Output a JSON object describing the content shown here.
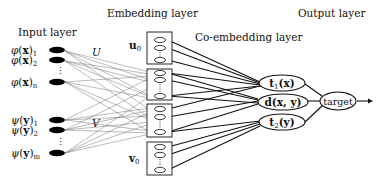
{
  "titles": {
    "input_layer": "Input layer",
    "embedding_layer": "Embedding layer",
    "coembedding_layer": "Co-embedding layer",
    "output_layer": "Output layer"
  },
  "weights": {
    "U": "U",
    "V": "V"
  },
  "input_nodes": {
    "phi": {
      "func": "φ",
      "var": "x",
      "indices": [
        "1",
        "2",
        "n"
      ]
    },
    "psi": {
      "func": "ψ",
      "var": "y",
      "indices": [
        "1",
        "2",
        "m"
      ]
    }
  },
  "embedding_boxes": [
    {
      "label": "u",
      "sub": "0"
    },
    {
      "label": "",
      "sub": ""
    },
    {
      "label": "",
      "sub": ""
    },
    {
      "label": "v",
      "sub": "0"
    }
  ],
  "coembedding_nodes": [
    {
      "name": "t",
      "sub": "1",
      "arg": "(x)"
    },
    {
      "name": "d",
      "sub": "",
      "arg": "(x, y)"
    },
    {
      "name": "t",
      "sub": "2",
      "arg": "(y)"
    }
  ],
  "output_node": {
    "label": "target"
  },
  "colors": {
    "node_fill": "#000000",
    "line": "#111111",
    "thin_line": "#777777"
  }
}
